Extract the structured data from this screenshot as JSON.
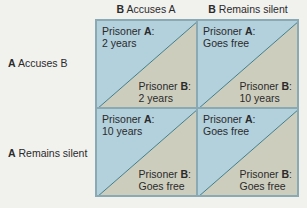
{
  "columns": [
    {
      "player": "B",
      "action": "Accuses A"
    },
    {
      "player": "B",
      "action": "Remains silent"
    }
  ],
  "rows": [
    {
      "player": "A",
      "action": "Accuses B"
    },
    {
      "player": "A",
      "action": "Remains silent"
    }
  ],
  "cells": [
    {
      "a_label": "Prisoner ",
      "a_player": "A",
      "a_colon": ":",
      "a_outcome": "2 years",
      "b_label": "Prisoner ",
      "b_player": "B",
      "b_colon": ":",
      "b_outcome": "2 years"
    },
    {
      "a_label": "Prisoner ",
      "a_player": "A",
      "a_colon": ":",
      "a_outcome": "Goes free",
      "b_label": "Prisoner ",
      "b_player": "B",
      "b_colon": ":",
      "b_outcome": "10 years"
    },
    {
      "a_label": "Prisoner ",
      "a_player": "A",
      "a_colon": ":",
      "a_outcome": "10 years",
      "b_label": "Prisoner ",
      "b_player": "B",
      "b_colon": ":",
      "b_outcome": "Goes free"
    },
    {
      "a_label": "Prisoner ",
      "a_player": "A",
      "a_colon": ":",
      "a_outcome": "Goes free",
      "b_label": "Prisoner ",
      "b_player": "B",
      "b_colon": ":",
      "b_outcome": "Goes free"
    }
  ],
  "colors": {
    "prisoner_a_fill": "#b3d0dd",
    "prisoner_b_fill": "#cdcdbd",
    "border": "#8aa9b2",
    "diagonal": "#3e7f8c",
    "background": "#f1f1ee"
  }
}
